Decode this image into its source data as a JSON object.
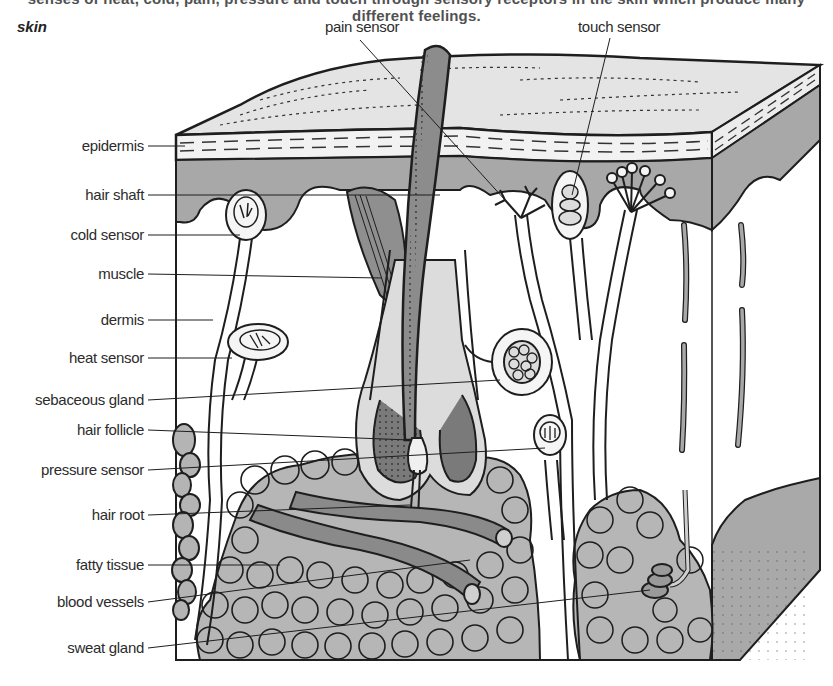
{
  "caption": "senses of heat, cold, pain, pressure and touch through sensory receptors in the skin which produce many different feelings.",
  "title": "skin",
  "labels": {
    "top": [
      {
        "id": "pain-sensor",
        "text": "pain sensor"
      },
      {
        "id": "touch-sensor",
        "text": "touch sensor"
      }
    ],
    "left": [
      {
        "id": "epidermis",
        "text": "epidermis"
      },
      {
        "id": "hair-shaft",
        "text": "hair shaft"
      },
      {
        "id": "cold-sensor",
        "text": "cold sensor"
      },
      {
        "id": "muscle",
        "text": "muscle"
      },
      {
        "id": "dermis",
        "text": "dermis"
      },
      {
        "id": "heat-sensor",
        "text": "heat sensor"
      },
      {
        "id": "sebaceous-gland",
        "text": "sebaceous gland"
      },
      {
        "id": "hair-follicle",
        "text": "hair follicle"
      },
      {
        "id": "pressure-sensor",
        "text": "pressure sensor"
      },
      {
        "id": "hair-root",
        "text": "hair root"
      },
      {
        "id": "fatty-tissue",
        "text": "fatty tissue"
      },
      {
        "id": "blood-vessels",
        "text": "blood vessels"
      },
      {
        "id": "sweat-gland",
        "text": "sweat gland"
      }
    ]
  },
  "colors": {
    "outline": "#1e1e1e",
    "surface": "#e6e6e6",
    "epidermis_band": "#f2f2f2",
    "dermis_shade": "#a9a9a9",
    "dermis_light": "#f7f7f7",
    "fat": "#bdbdbd",
    "hair": "#8c8c8c",
    "vessel": "#8a8a8a"
  }
}
